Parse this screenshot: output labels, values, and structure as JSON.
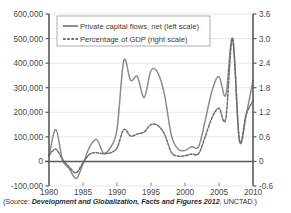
{
  "figure": {
    "source_prefix": "(Source: ",
    "source_italic": "Development and Globalization, Facts and Figures 2012",
    "source_suffix": ", UNCTAD.)"
  },
  "legend": {
    "items": [
      {
        "label": "Private capital flows, net (left scale)",
        "style": "solid",
        "color": "#8c8c8c"
      },
      {
        "label": "Percentage of GDP (right scale)",
        "style": "dashed",
        "color": "#6e6e6e"
      }
    ]
  },
  "chart_data": {
    "type": "line",
    "title": "",
    "xlabel": "",
    "ylabel": "",
    "grid": true,
    "legend_position": "top-center",
    "x": [
      1980,
      1981,
      1982,
      1983,
      1984,
      1985,
      1986,
      1987,
      1988,
      1989,
      1990,
      1991,
      1992,
      1993,
      1994,
      1995,
      1996,
      1997,
      1998,
      1999,
      2000,
      2001,
      2002,
      2003,
      2004,
      2005,
      2006,
      2007,
      2008,
      2009,
      2010
    ],
    "xlim": [
      1980,
      2010
    ],
    "xticks": [
      1980,
      1985,
      1990,
      1995,
      2000,
      2005,
      2010
    ],
    "xticklabels": [
      "1980",
      "1985",
      "1990",
      "1995",
      "2000",
      "2005",
      "2010"
    ],
    "left_axis": {
      "label": "",
      "ylim": [
        -100000,
        600000
      ],
      "yticks": [
        -100000,
        0,
        100000,
        200000,
        300000,
        400000,
        500000,
        600000
      ],
      "yticklabels": [
        "-100,000",
        "0",
        "100,000",
        "200,000",
        "300,000",
        "400,000",
        "500,000",
        "600,000"
      ]
    },
    "right_axis": {
      "label": "",
      "ylim": [
        -0.6,
        3.6
      ],
      "yticks": [
        -0.6,
        0,
        0.6,
        1.2,
        1.8,
        2.4,
        3.0,
        3.6
      ],
      "yticklabels": [
        "-0.6",
        "0",
        "0.6",
        "1.2",
        "1.8",
        "2.4",
        "3.0",
        "3.6"
      ]
    },
    "series": [
      {
        "name": "Private capital flows, net (left scale)",
        "axis": "left",
        "style": "solid",
        "color": "#8c8c8c",
        "values": [
          20000,
          130000,
          5000,
          -30000,
          -70000,
          -10000,
          60000,
          90000,
          35000,
          55000,
          130000,
          410000,
          330000,
          345000,
          260000,
          370000,
          360000,
          270000,
          105000,
          50000,
          45000,
          60000,
          60000,
          170000,
          290000,
          345000,
          270000,
          500000,
          85000,
          190000,
          330000
        ]
      },
      {
        "name": "Percentage of GDP (right scale)",
        "axis": "right",
        "style": "dashed",
        "color": "#6e6e6e",
        "values": [
          0.15,
          0.3,
          0.05,
          -0.14,
          -0.28,
          -0.03,
          0.18,
          0.21,
          0.19,
          0.21,
          0.33,
          0.78,
          0.62,
          0.67,
          0.72,
          0.9,
          0.88,
          0.66,
          0.22,
          0.13,
          0.14,
          0.18,
          0.19,
          0.62,
          1.08,
          1.3,
          1.05,
          3.0,
          0.52,
          1.15,
          1.48
        ]
      }
    ]
  }
}
